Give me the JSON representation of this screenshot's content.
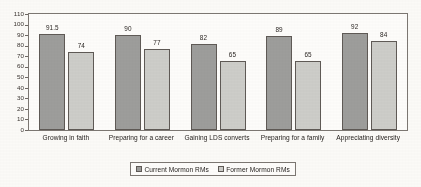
{
  "chart_data": {
    "type": "bar",
    "title": "",
    "xlabel": "",
    "ylabel": "",
    "ylim": [
      0,
      110
    ],
    "ytick_step": 10,
    "yticks": [
      "110",
      "100",
      "90",
      "80",
      "70",
      "60",
      "50",
      "40",
      "30",
      "20",
      "10",
      "0"
    ],
    "grid": false,
    "legend_position": "bottom",
    "categories": [
      "Growing in faith",
      "Preparing for a career",
      "Gaining LDS converts",
      "Preparing for a family",
      "Appreciating diversity"
    ],
    "series": [
      {
        "name": "Current Mormon RMs",
        "color": "#9d9d9b",
        "values": [
          91.5,
          90,
          82,
          89,
          92
        ],
        "labels": [
          "91.5",
          "90",
          "82",
          "89",
          "92"
        ]
      },
      {
        "name": "Former Mormon RMs",
        "color": "#cdcdc9",
        "values": [
          74,
          77,
          65,
          65,
          84
        ],
        "labels": [
          "74",
          "77",
          "65",
          "65",
          "84"
        ]
      }
    ]
  },
  "legend": {
    "items": [
      {
        "label": "Current Mormon RMs",
        "swatch": "series-0-swatch"
      },
      {
        "label": "Former Mormon RMs",
        "swatch": "series-1-swatch"
      }
    ]
  }
}
